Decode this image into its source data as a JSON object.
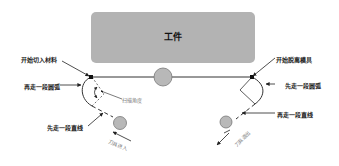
{
  "diagram": {
    "workpiece": {
      "label": "工件",
      "color": "#b3b3b3"
    },
    "labels": {
      "start_cut_in": "开始切入材料",
      "first_arc_left": "再走一段圆弧",
      "sweep_angle": "扫描角度",
      "first_line_left": "先走一段直线",
      "tool_entry": "刀具进入",
      "start_cut_out": "开始脱离模具",
      "first_arc_right": "先走一段圆弧",
      "then_line_right": "再走一段直线",
      "tool_exit": "刀具退出"
    },
    "colors": {
      "tool_circle": "#b8b8b8",
      "tool_circle_stroke": "#777777",
      "path_line": "#333333",
      "arrow": "#222222"
    }
  }
}
